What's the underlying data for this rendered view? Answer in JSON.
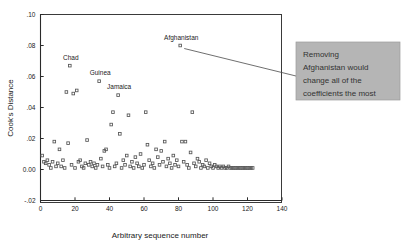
{
  "chart_data": {
    "type": "scatter",
    "title": "",
    "xlabel": "Arbitrary sequence number",
    "ylabel": "Cook's Distance",
    "xlim": [
      0,
      140
    ],
    "ylim": [
      -0.02,
      0.1
    ],
    "xticks": [
      0,
      20,
      40,
      60,
      80,
      100,
      120,
      140
    ],
    "xtick_labels": [
      "0",
      "20",
      "40",
      "60",
      "80",
      "100",
      "120",
      "140"
    ],
    "yticks": [
      -0.02,
      0.0,
      0.02,
      0.04,
      0.06,
      0.08,
      0.1
    ],
    "ytick_labels": [
      "-.02",
      "0.00",
      ".02",
      ".04",
      ".06",
      ".08",
      ".10"
    ],
    "grid": false,
    "legend": null,
    "marker": "open-square",
    "annotations": [
      {
        "text": "Chad",
        "x": 17,
        "y": 0.067
      },
      {
        "text": "Guinea",
        "x": 34,
        "y": 0.057
      },
      {
        "text": "Jamaica",
        "x": 45,
        "y": 0.048
      },
      {
        "text": "Afghanistan",
        "x": 81,
        "y": 0.08
      }
    ],
    "callout": {
      "text": "Removing Afghanistan would change all of the coefficients the most",
      "lines": [
        "Removing",
        "Afghanistan would",
        "change all of the",
        "coefficients the most"
      ],
      "points_to": {
        "x": 81,
        "y": 0.08
      },
      "background_color": "#b5b5b5",
      "text_color": "#333333"
    },
    "points": [
      [
        1,
        0.009
      ],
      [
        2,
        0.005
      ],
      [
        3,
        0.004
      ],
      [
        4,
        0.006
      ],
      [
        5,
        0.003
      ],
      [
        6,
        0.001
      ],
      [
        7,
        0.005
      ],
      [
        8,
        0.018
      ],
      [
        9,
        0.002
      ],
      [
        10,
        0.004
      ],
      [
        11,
        0.013
      ],
      [
        12,
        0.002
      ],
      [
        13,
        0.006
      ],
      [
        14,
        0.001
      ],
      [
        15,
        0.05
      ],
      [
        16,
        0.017
      ],
      [
        17,
        0.067
      ],
      [
        18,
        0.003
      ],
      [
        19,
        0.049
      ],
      [
        20,
        0.001
      ],
      [
        21,
        0.051
      ],
      [
        22,
        0.005
      ],
      [
        23,
        0.006
      ],
      [
        24,
        0.002
      ],
      [
        25,
        0.001
      ],
      [
        26,
        0.004
      ],
      [
        27,
        0.019
      ],
      [
        28,
        0.003
      ],
      [
        29,
        0.005
      ],
      [
        30,
        0.002
      ],
      [
        31,
        0.004
      ],
      [
        32,
        0.001
      ],
      [
        33,
        0.003
      ],
      [
        34,
        0.057
      ],
      [
        35,
        0.007
      ],
      [
        36,
        0.002
      ],
      [
        37,
        0.012
      ],
      [
        38,
        0.013
      ],
      [
        39,
        0.003
      ],
      [
        40,
        0.001
      ],
      [
        41,
        0.029
      ],
      [
        42,
        0.037
      ],
      [
        43,
        0.002
      ],
      [
        44,
        0.004
      ],
      [
        45,
        0.048
      ],
      [
        46,
        0.023
      ],
      [
        47,
        0.001
      ],
      [
        48,
        0.006
      ],
      [
        49,
        0.003
      ],
      [
        50,
        0.009
      ],
      [
        51,
        0.035
      ],
      [
        52,
        0.002
      ],
      [
        53,
        0.005
      ],
      [
        54,
        0.001
      ],
      [
        55,
        0.008
      ],
      [
        56,
        0.004
      ],
      [
        57,
        0.002
      ],
      [
        58,
        0.01
      ],
      [
        59,
        0.001
      ],
      [
        60,
        0.003
      ],
      [
        61,
        0.037
      ],
      [
        62,
        0.016
      ],
      [
        63,
        0.006
      ],
      [
        64,
        0.002
      ],
      [
        65,
        0.004
      ],
      [
        66,
        0.001
      ],
      [
        67,
        0.013
      ],
      [
        68,
        0.008
      ],
      [
        69,
        0.003
      ],
      [
        70,
        0.012
      ],
      [
        71,
        0.005
      ],
      [
        72,
        0.018
      ],
      [
        73,
        0.002
      ],
      [
        74,
        0.007
      ],
      [
        75,
        0.004
      ],
      [
        76,
        0.001
      ],
      [
        77,
        0.009
      ],
      [
        78,
        0.003
      ],
      [
        79,
        0.006
      ],
      [
        80,
        0.002
      ],
      [
        81,
        0.08
      ],
      [
        82,
        0.018
      ],
      [
        83,
        0.005
      ],
      [
        84,
        0.018
      ],
      [
        85,
        0.003
      ],
      [
        86,
        0.001
      ],
      [
        87,
        0.011
      ],
      [
        88,
        0.037
      ],
      [
        89,
        0.004
      ],
      [
        90,
        0.002
      ],
      [
        91,
        0.007
      ],
      [
        92,
        0.005
      ],
      [
        93,
        0.001
      ],
      [
        94,
        0.003
      ],
      [
        95,
        0.002
      ],
      [
        96,
        0.006
      ],
      [
        97,
        0.001
      ],
      [
        98,
        0.004
      ],
      [
        99,
        0.002
      ],
      [
        100,
        0.001
      ],
      [
        101,
        0.003
      ],
      [
        102,
        0.002
      ],
      [
        103,
        0.001
      ],
      [
        104,
        0.002
      ],
      [
        105,
        0.001
      ],
      [
        106,
        0.002
      ],
      [
        107,
        0.001
      ],
      [
        108,
        0.001
      ],
      [
        109,
        0.002
      ],
      [
        110,
        0.001
      ],
      [
        111,
        0.001
      ],
      [
        112,
        0.001
      ],
      [
        113,
        0.001
      ],
      [
        114,
        0.001
      ],
      [
        115,
        0.001
      ],
      [
        116,
        0.001
      ],
      [
        117,
        0.001
      ],
      [
        118,
        0.001
      ],
      [
        119,
        0.001
      ],
      [
        120,
        0.001
      ],
      [
        121,
        0.001
      ],
      [
        122,
        0.001
      ],
      [
        123,
        0.001
      ]
    ]
  }
}
